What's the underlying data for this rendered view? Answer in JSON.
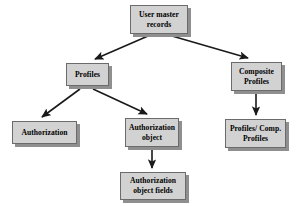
{
  "diagram": {
    "background_color": "#ffffff",
    "node_fill_color": "#d2d2d2",
    "node_border_color": "#6b6b6b",
    "node_shadow_color": "#8f8f8f",
    "edge_color": "#1a1a1a",
    "nodes": [
      {
        "id": "user_master_records",
        "label": "User master records"
      },
      {
        "id": "profiles",
        "label": "Profiles"
      },
      {
        "id": "composite_profiles",
        "label": "Composite Profiles"
      },
      {
        "id": "authorization",
        "label": "Authorization"
      },
      {
        "id": "authorization_object",
        "label": "Authorization object"
      },
      {
        "id": "profiles_comp_profiles",
        "label": "Profiles/ Comp. Profiles"
      },
      {
        "id": "authorization_object_fields",
        "label": "Authorization object fields"
      }
    ],
    "edges": [
      {
        "from": "user_master_records",
        "to": "profiles",
        "style": "diagonal-arrow"
      },
      {
        "from": "user_master_records",
        "to": "composite_profiles",
        "style": "diagonal-arrow"
      },
      {
        "from": "profiles",
        "to": "authorization",
        "style": "diagonal-arrow"
      },
      {
        "from": "profiles",
        "to": "authorization_object",
        "style": "diagonal-arrow"
      },
      {
        "from": "composite_profiles",
        "to": "profiles_comp_profiles",
        "style": "vertical-arrow"
      },
      {
        "from": "authorization_object",
        "to": "authorization_object_fields",
        "style": "vertical-arrow"
      }
    ]
  }
}
